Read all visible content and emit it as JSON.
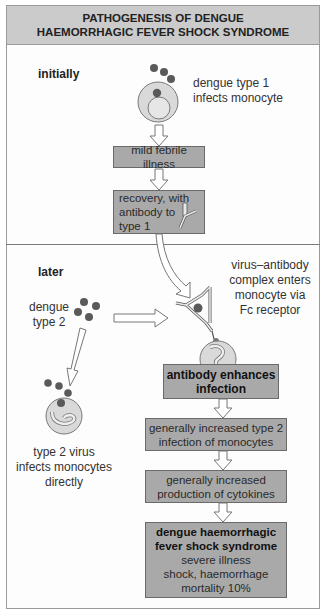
{
  "title": {
    "line1": "PATHOGENESIS OF DENGUE",
    "line2": "HAEMORRHAGIC FEVER SHOCK SYNDROME"
  },
  "colors": {
    "header_bg": "#cbcbcb",
    "box_bg": "#a9a9a9",
    "virus": "#5a5a5a",
    "cell": "#d9d9d9",
    "border": "#9a9a9a"
  },
  "initially": {
    "section_label": "initially",
    "infection_caption": [
      "dengue type 1",
      "infects monocyte"
    ],
    "boxes": [
      {
        "lines": [
          "mild febrile illness"
        ]
      },
      {
        "lines": [
          "recovery, with",
          "antibody to",
          "type 1"
        ]
      }
    ]
  },
  "later": {
    "section_label": "later",
    "virus_caption": [
      "dengue",
      "type 2"
    ],
    "complex_caption": [
      "virus–antibody",
      "complex enters",
      "monocyte via",
      "Fc receptor"
    ],
    "direct_caption": [
      "type 2 virus",
      "infects monocytes",
      "directly"
    ],
    "boxes": [
      {
        "bold": [
          "antibody enhances",
          "infection"
        ],
        "lines": []
      },
      {
        "bold": [],
        "lines": [
          "generally increased type 2",
          "infection of monocytes"
        ]
      },
      {
        "bold": [],
        "lines": [
          "generally increased",
          "production of cytokines"
        ]
      },
      {
        "bold": [
          "dengue haemorrhagic",
          "fever shock syndrome"
        ],
        "lines": [
          "severe illness",
          "shock, haemorrhage",
          "mortality 10%"
        ]
      }
    ]
  }
}
